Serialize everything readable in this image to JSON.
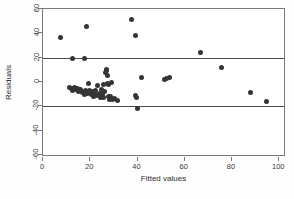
{
  "chart_data": {
    "type": "scatter",
    "title": "",
    "xlabel": "Fitted values",
    "ylabel": "Residuals",
    "xlim": [
      0,
      102
    ],
    "ylim": [
      -60,
      60
    ],
    "xticks": [
      0,
      20,
      40,
      60,
      80,
      100
    ],
    "yticks": [
      60,
      40,
      20,
      0,
      -20,
      -40,
      -60
    ],
    "grid": false,
    "legend": null,
    "reference_lines": [
      {
        "orientation": "horizontal",
        "y": 20,
        "color": "#4a4a4a"
      },
      {
        "orientation": "horizontal",
        "y": -20,
        "color": "#4a4a4a"
      }
    ],
    "marker": {
      "shape": "circle",
      "color": "#353535",
      "size": 5
    },
    "series": [
      {
        "name": "residuals",
        "points": [
          [
            7.6,
            36.3
          ],
          [
            12.6,
            19.6
          ],
          [
            17.6,
            19.3
          ],
          [
            18.6,
            45.5
          ],
          [
            37.6,
            51.0
          ],
          [
            39.0,
            38.6
          ],
          [
            66.8,
            24.0
          ],
          [
            75.6,
            12.2
          ],
          [
            87.8,
            -8.9
          ],
          [
            94.8,
            -15.8
          ],
          [
            41.6,
            3.4
          ],
          [
            51.6,
            2.2
          ],
          [
            52.4,
            2.8
          ],
          [
            53.6,
            3.8
          ],
          [
            39.2,
            -11.0
          ],
          [
            39.6,
            -12.8
          ],
          [
            39.8,
            -21.8
          ],
          [
            11.4,
            -4.2
          ],
          [
            12.2,
            -5.0
          ],
          [
            12.6,
            -6.6
          ],
          [
            13.2,
            -4.6
          ],
          [
            13.8,
            -6.2
          ],
          [
            14.4,
            -5.4
          ],
          [
            15.0,
            -7.6
          ],
          [
            16.0,
            -6.0
          ],
          [
            16.8,
            -8.6
          ],
          [
            17.4,
            -10.0
          ],
          [
            18.0,
            -6.8
          ],
          [
            18.8,
            -9.4
          ],
          [
            19.4,
            -1.6
          ],
          [
            19.8,
            -7.2
          ],
          [
            20.4,
            -10.6
          ],
          [
            20.8,
            -8.2
          ],
          [
            21.4,
            -12.0
          ],
          [
            21.8,
            -9.0
          ],
          [
            22.4,
            -7.0
          ],
          [
            22.8,
            -11.2
          ],
          [
            23.2,
            -3.2
          ],
          [
            23.8,
            -9.8
          ],
          [
            24.2,
            -12.4
          ],
          [
            24.6,
            -6.4
          ],
          [
            25.0,
            -10.2
          ],
          [
            25.4,
            -2.4
          ],
          [
            25.8,
            -13.0
          ],
          [
            26.2,
            -8.0
          ],
          [
            26.4,
            8.0
          ],
          [
            26.8,
            9.6
          ],
          [
            27.0,
            10.6
          ],
          [
            27.2,
            5.2
          ],
          [
            27.4,
            -1.0
          ],
          [
            27.6,
            -2.0
          ],
          [
            27.8,
            -11.6
          ],
          [
            28.0,
            -14.0
          ],
          [
            28.4,
            -12.2
          ],
          [
            28.8,
            -0.6
          ],
          [
            29.2,
            -13.4
          ],
          [
            29.6,
            -14.6
          ],
          [
            30.4,
            -13.2
          ],
          [
            31.4,
            -15.2
          ]
        ]
      }
    ]
  }
}
